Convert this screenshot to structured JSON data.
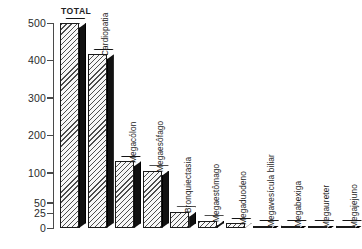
{
  "chart_data": {
    "type": "bar",
    "title": "",
    "xlabel": "",
    "ylabel": "",
    "grid": false,
    "legend": "none",
    "axis_note": "piecewise y-axis: 0-100 compressed, 100-500 linear",
    "ytick_labels": [
      "0",
      "25",
      "50",
      "100",
      "200",
      "300",
      "400",
      "500"
    ],
    "ytick_values": [
      0,
      25,
      50,
      100,
      200,
      300,
      400,
      500
    ],
    "ylim": [
      0,
      500
    ],
    "categories": [
      "TOTAL",
      "Cardiopatia",
      "Megacólon",
      "Megaesôfago",
      "Bronquiectasia",
      "Megaestômago",
      "Megaduodeno",
      "Megavesícula biliar",
      "Megabexiga",
      "Megaureter",
      "Megajejuno"
    ],
    "values": [
      500,
      415,
      130,
      105,
      28,
      12,
      8,
      4,
      4,
      3,
      3
    ]
  },
  "bars": [
    {
      "label": "TOTAL",
      "value": 500,
      "orientation": "horizontal"
    },
    {
      "label": "Cardiopatia",
      "value": 415,
      "orientation": "vertical"
    },
    {
      "label": "Megacólon",
      "value": 130,
      "orientation": "vertical"
    },
    {
      "label": "Megaesôfago",
      "value": 105,
      "orientation": "vertical"
    },
    {
      "label": "Bronquiectasia",
      "value": 28,
      "orientation": "vertical"
    },
    {
      "label": "Megaestômago",
      "value": 12,
      "orientation": "vertical"
    },
    {
      "label": "Megaduodeno",
      "value": 8,
      "orientation": "vertical"
    },
    {
      "label": "Megavesícula biliar",
      "value": 4,
      "orientation": "vertical"
    },
    {
      "label": "Megabexiga",
      "value": 4,
      "orientation": "vertical"
    },
    {
      "label": "Megaureter",
      "value": 3,
      "orientation": "vertical"
    },
    {
      "label": "Megajejuno",
      "value": 3,
      "orientation": "vertical"
    }
  ],
  "axis": {
    "ticks": [
      {
        "label": "500",
        "value": 500
      },
      {
        "label": "400",
        "value": 400
      },
      {
        "label": "300",
        "value": 300
      },
      {
        "label": "200",
        "value": 200
      },
      {
        "label": "100",
        "value": 100
      },
      {
        "label": "50",
        "value": 50
      },
      {
        "label": "25",
        "value": 25
      },
      {
        "label": "0",
        "value": 0
      }
    ]
  },
  "colors": {
    "bar_face": "#f7f7f7",
    "bar_hatch": "#4d4d4d",
    "bar_side": "#111111",
    "outline": "#1a1a1a",
    "axis": "#4a4a4a",
    "text": "#232323",
    "background": "#ffffff"
  }
}
